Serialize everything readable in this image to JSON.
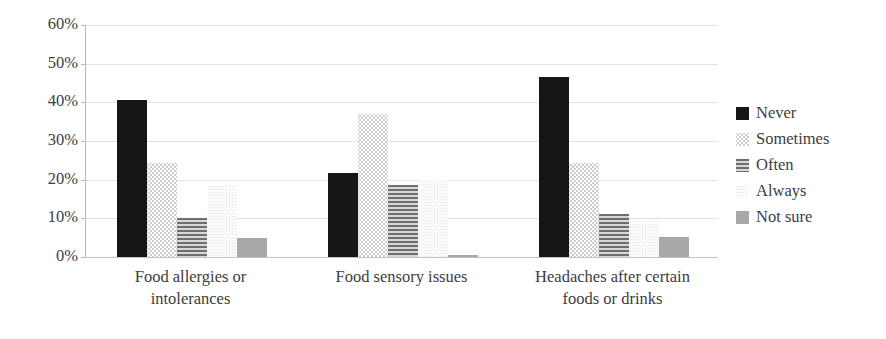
{
  "chart_data": {
    "type": "bar",
    "title": "",
    "xlabel": "",
    "ylabel": "",
    "ylim": [
      0,
      60
    ],
    "grid": true,
    "legend_position": "right",
    "y_ticks": [
      "0%",
      "10%",
      "20%",
      "30%",
      "40%",
      "50%",
      "60%"
    ],
    "y_tick_values": [
      0,
      10,
      20,
      30,
      40,
      50,
      60
    ],
    "categories": [
      "Food allergies or intolerances",
      "Food sensory issues",
      "Headaches after certain foods or drinks"
    ],
    "category_lines": [
      [
        "Food allergies or",
        "intolerances"
      ],
      [
        "Food sensory issues"
      ],
      [
        "Headaches after certain",
        "foods or drinks"
      ]
    ],
    "series": [
      {
        "name": "Never",
        "fill": "solid-black",
        "color": "#161616",
        "values": [
          40.6,
          21.6,
          46.5
        ]
      },
      {
        "name": "Sometimes",
        "fill": "dotted-light",
        "color": "#c9c9c9",
        "values": [
          24.4,
          37.0,
          24.4
        ]
      },
      {
        "name": "Often",
        "fill": "horizontal-lines",
        "color": "#6e6e6e",
        "values": [
          10.0,
          18.7,
          11.2
        ]
      },
      {
        "name": "Always",
        "fill": "speckle-faint",
        "color": "#e4e4e4",
        "values": [
          18.7,
          20.0,
          9.5
        ]
      },
      {
        "name": "Not sure",
        "fill": "solid-gray",
        "color": "#a8a8a8",
        "values": [
          4.8,
          0.5,
          5.2
        ]
      }
    ]
  },
  "legend": {
    "items": [
      {
        "label": "Never"
      },
      {
        "label": "Sometimes"
      },
      {
        "label": "Often"
      },
      {
        "label": "Always"
      },
      {
        "label": "Not sure"
      }
    ]
  }
}
